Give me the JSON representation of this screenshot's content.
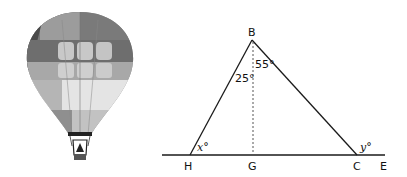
{
  "figure": {
    "illustration": "hot-air-balloon",
    "points": {
      "B": "B",
      "H": "H",
      "G": "G",
      "C": "C",
      "E": "E"
    },
    "angles": {
      "angle_HBG": "25°",
      "angle_GBC": "55°",
      "angle_BHG": "x°",
      "angle_BCE": "y°"
    },
    "colors": {
      "line": "#1a1a1a",
      "dashed": "#555555",
      "balloon_dark": "#5a5a5a",
      "balloon_mid": "#8c8c8c",
      "balloon_light": "#bdbdbd",
      "balloon_lightest": "#e6e6e6"
    }
  }
}
